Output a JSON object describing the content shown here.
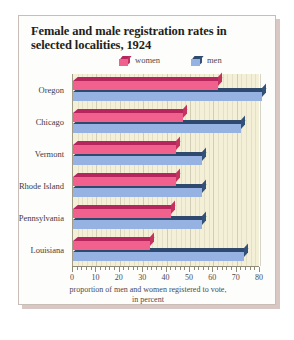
{
  "chart_data": {
    "type": "bar",
    "orientation": "horizontal",
    "title": "Female and male registration rates in selected localities, 1924",
    "xlabel": "proportion of men and women registered to vote, in percent",
    "ylabel": "",
    "categories": [
      "Oregon",
      "Chicago",
      "Vermont",
      "Rhode Island",
      "Pennsylvania",
      "Louisiana"
    ],
    "series": [
      {
        "name": "women",
        "color": "#f0628d",
        "values": [
          62,
          47,
          44,
          44,
          42,
          33
        ]
      },
      {
        "name": "men",
        "color": "#95b2e2",
        "values": [
          81,
          72,
          55,
          55,
          55,
          73
        ]
      }
    ],
    "xlim": [
      0,
      80
    ],
    "xticks": [
      0,
      10,
      20,
      30,
      40,
      50,
      60,
      70,
      80
    ],
    "xtick_labels": [
      "0",
      "10",
      "20",
      "30",
      "40",
      "50",
      "60",
      "70",
      "80"
    ],
    "grid": true,
    "legend_position": "top-right",
    "plot_background": "#f4f0d8"
  },
  "legend": {
    "items": [
      {
        "label": "women",
        "icon": "cube-icon",
        "color": "#f0628d"
      },
      {
        "label": "men",
        "icon": "cube-icon",
        "color": "#95b2e2"
      }
    ]
  },
  "caption": {
    "line1": "proportion of men and women registered to vote,",
    "line2": "in percent"
  }
}
